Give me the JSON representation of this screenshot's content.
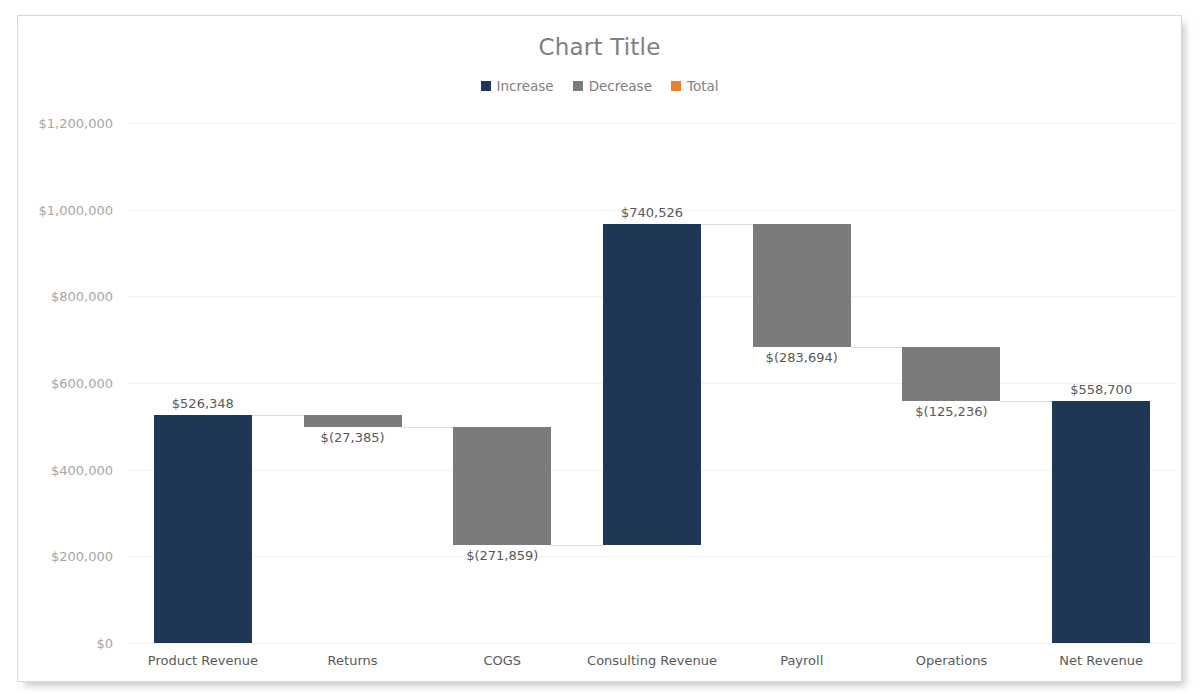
{
  "chart": {
    "title": "Chart Title",
    "title_color": "#7f7f7f",
    "background": "#ffffff",
    "border_color": "#d8d8d8"
  },
  "legend": {
    "position": "top-center",
    "items": [
      {
        "label": "Increase",
        "color": "#1F3757"
      },
      {
        "label": "Decrease",
        "color": "#7B7B7B"
      },
      {
        "label": "Total",
        "color": "#ED7D31"
      }
    ]
  },
  "axis": {
    "y_ticks": [
      "$0",
      "$200,000",
      "$400,000",
      "$600,000",
      "$800,000",
      "$1,000,000",
      "$1,200,000"
    ],
    "y_tick_values": [
      0,
      200000,
      400000,
      600000,
      800000,
      1000000,
      1200000
    ],
    "y_min": 0,
    "y_max": 1200000,
    "x_ticks": [
      "Product Revenue",
      "Returns",
      "COGS",
      "Consulting Revenue",
      "Payroll",
      "Operations",
      "Net Revenue"
    ]
  },
  "chart_data": {
    "type": "bar",
    "subtype": "waterfall",
    "title": "Chart Title",
    "xlabel": "",
    "ylabel": "",
    "ylim": [
      0,
      1200000
    ],
    "grid": true,
    "legend_position": "top-center",
    "categories": [
      "Product Revenue",
      "Returns",
      "COGS",
      "Consulting Revenue",
      "Payroll",
      "Operations",
      "Net Revenue"
    ],
    "values": [
      526348,
      -27385,
      -271859,
      740526,
      -283694,
      -125236,
      558700
    ],
    "labels": [
      "$526,348",
      "$(27,385)",
      "$(271,859)",
      "$740,526",
      "$(283,694)",
      "$(125,236)",
      "$558,700"
    ],
    "kinds": [
      "increase",
      "decrease",
      "decrease",
      "increase",
      "decrease",
      "decrease",
      "total"
    ],
    "bar_colors": [
      "#1F3757",
      "#7B7B7B",
      "#7B7B7B",
      "#1F3757",
      "#7B7B7B",
      "#7B7B7B",
      "#1F3757"
    ],
    "bar_bases": [
      0,
      498963,
      227104,
      227104,
      683936,
      558700,
      0
    ],
    "bar_tops": [
      526348,
      526348,
      498963,
      967630,
      967630,
      683936,
      558700
    ],
    "cumulative": [
      526348,
      498963,
      227104,
      967630,
      683936,
      558700,
      558700
    ],
    "label_positions": [
      "above",
      "below",
      "below",
      "above",
      "below",
      "below",
      "above"
    ],
    "series": [
      {
        "name": "Increase",
        "color": "#1F3757"
      },
      {
        "name": "Decrease",
        "color": "#7B7B7B"
      },
      {
        "name": "Total",
        "color": "#ED7D31"
      }
    ]
  }
}
